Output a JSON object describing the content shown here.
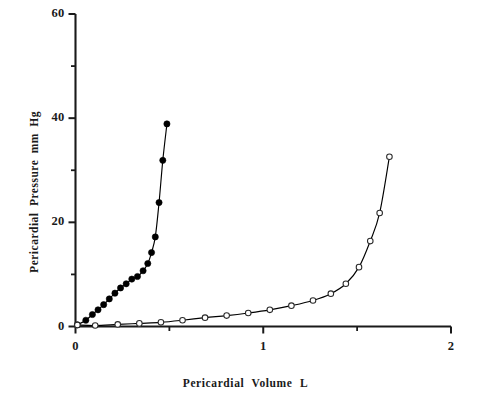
{
  "chart_data": {
    "type": "line",
    "title": "",
    "xlabel": "Pericardial   Volume   L",
    "ylabel": "Pericardial  Pressure  mm Hg",
    "xlim": [
      0,
      2
    ],
    "ylim": [
      0,
      60
    ],
    "grid": false,
    "legend": "none",
    "x_major_ticks": [
      0,
      1,
      2
    ],
    "x_major_tick_labels": [
      "0",
      "1",
      "2"
    ],
    "x_minor_ticks": [
      0.5,
      1.5
    ],
    "y_major_ticks": [
      0,
      20,
      40,
      60
    ],
    "y_major_tick_labels": [
      "0",
      "20",
      "40",
      "60"
    ],
    "y_minor_ticks": [
      10,
      30,
      50
    ],
    "series": [
      {
        "name": "filled-circle-curve",
        "marker": "filled-circle",
        "color": "#000000",
        "points": [
          [
            0.01,
            0.3
          ],
          [
            0.055,
            1.2
          ],
          [
            0.09,
            2.3
          ],
          [
            0.12,
            3.2
          ],
          [
            0.15,
            4.2
          ],
          [
            0.18,
            5.3
          ],
          [
            0.21,
            6.4
          ],
          [
            0.24,
            7.4
          ],
          [
            0.27,
            8.2
          ],
          [
            0.3,
            9.1
          ],
          [
            0.33,
            9.6
          ],
          [
            0.36,
            10.7
          ],
          [
            0.385,
            12.1
          ],
          [
            0.405,
            14.2
          ],
          [
            0.425,
            17.2
          ],
          [
            0.445,
            23.8
          ],
          [
            0.465,
            31.9
          ],
          [
            0.487,
            38.9
          ]
        ]
      },
      {
        "name": "open-circle-curve",
        "marker": "open-circle",
        "color": "#000000",
        "points": [
          [
            0.01,
            0.3
          ],
          [
            0.105,
            0.2
          ],
          [
            0.225,
            0.4
          ],
          [
            0.34,
            0.6
          ],
          [
            0.455,
            0.8
          ],
          [
            0.57,
            1.2
          ],
          [
            0.69,
            1.7
          ],
          [
            0.805,
            2.1
          ],
          [
            0.92,
            2.6
          ],
          [
            1.035,
            3.2
          ],
          [
            1.15,
            4.0
          ],
          [
            1.265,
            5.0
          ],
          [
            1.36,
            6.3
          ],
          [
            1.44,
            8.2
          ],
          [
            1.51,
            11.4
          ],
          [
            1.57,
            16.4
          ],
          [
            1.62,
            21.8
          ],
          [
            1.672,
            32.6
          ]
        ]
      }
    ]
  },
  "axes": {
    "x_labels": [
      "0",
      "1",
      "2"
    ],
    "y_labels": [
      "0",
      "20",
      "40",
      "60"
    ],
    "x_title": "Pericardial   Volume   L",
    "y_title": "Pericardial  Pressure  mm Hg"
  }
}
